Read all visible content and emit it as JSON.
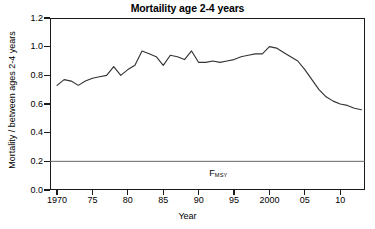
{
  "chart_data": {
    "type": "line",
    "title": "Mortaility age 2-4 years",
    "xlabel": "Year",
    "ylabel": "Mortality / between ages 2-4 years",
    "xlim": [
      1969,
      2013.5
    ],
    "ylim": [
      0.0,
      1.2
    ],
    "grid": false,
    "legend": null,
    "y_ticks": [
      "0.0",
      "0.2",
      "0.4",
      "0.6",
      "0.8",
      "1.0",
      "1.2"
    ],
    "y_tick_values": [
      0.0,
      0.2,
      0.4,
      0.6,
      0.8,
      1.0,
      1.2
    ],
    "x_ticks": [
      "1970",
      "75",
      "80",
      "85",
      "90",
      "95",
      "2000",
      "05",
      "10"
    ],
    "x_tick_values": [
      1970,
      1975,
      1980,
      1985,
      1990,
      1995,
      2000,
      2005,
      2010
    ],
    "x": [
      1970,
      1971,
      1972,
      1973,
      1974,
      1975,
      1976,
      1977,
      1978,
      1979,
      1980,
      1981,
      1982,
      1983,
      1984,
      1985,
      1986,
      1987,
      1988,
      1989,
      1990,
      1991,
      1992,
      1993,
      1994,
      1995,
      1996,
      1997,
      1998,
      1999,
      2000,
      2001,
      2002,
      2003,
      2004,
      2005,
      2006,
      2007,
      2008,
      2009,
      2010,
      2011,
      2012,
      2013
    ],
    "values": [
      0.73,
      0.77,
      0.76,
      0.73,
      0.76,
      0.78,
      0.79,
      0.8,
      0.86,
      0.8,
      0.84,
      0.87,
      0.97,
      0.95,
      0.93,
      0.87,
      0.94,
      0.93,
      0.91,
      0.97,
      0.89,
      0.89,
      0.9,
      0.89,
      0.9,
      0.91,
      0.93,
      0.94,
      0.95,
      0.95,
      1.0,
      0.99,
      0.96,
      0.93,
      0.9,
      0.84,
      0.77,
      0.7,
      0.65,
      0.62,
      0.6,
      0.59,
      0.57,
      0.56
    ],
    "annotations": [
      {
        "name": "fmsy-reference-line",
        "label": "F",
        "sublabel": "MSY",
        "value": 0.2,
        "orientation": "horizontal",
        "label_x": 1991.5,
        "label_y": 0.105,
        "color": "#555555"
      }
    ],
    "series_color": "#333333",
    "frame_color": "#1a1a1a",
    "background": "#ffffff"
  }
}
